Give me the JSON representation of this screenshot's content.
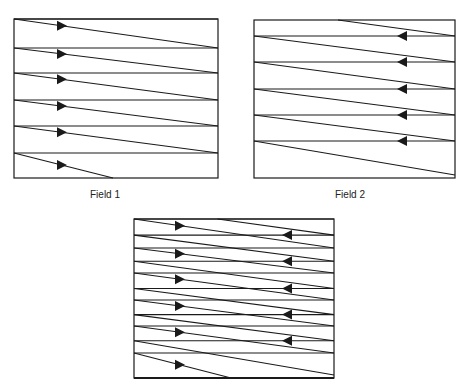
{
  "colors": {
    "line": "#1a1a1a",
    "background": "#ffffff"
  },
  "field1": {
    "label": "Field 1",
    "box": {
      "x1": 14,
      "y1": 19,
      "x2": 218,
      "y2": 178
    },
    "retrace_lines_y": [
      19,
      48,
      73,
      100,
      126,
      153
    ],
    "scan_lines": [
      {
        "from": [
          14,
          19
        ],
        "to": [
          218,
          48
        ]
      },
      {
        "from": [
          14,
          48
        ],
        "to": [
          218,
          73
        ]
      },
      {
        "from": [
          14,
          73
        ],
        "to": [
          218,
          100
        ]
      },
      {
        "from": [
          14,
          100
        ],
        "to": [
          218,
          126
        ]
      },
      {
        "from": [
          14,
          126
        ],
        "to": [
          218,
          153
        ]
      },
      {
        "from": [
          14,
          153
        ],
        "to": [
          113,
          178
        ]
      }
    ],
    "arrow_direction": "right",
    "arrow_x": 62
  },
  "field2": {
    "label": "Field 2",
    "box": {
      "x1": 254,
      "y1": 20,
      "x2": 455,
      "y2": 178
    },
    "retrace_lines_y": [
      36,
      62,
      89,
      115,
      141
    ],
    "scan_lines": [
      {
        "from": [
          338,
          20
        ],
        "to": [
          455,
          36
        ]
      },
      {
        "from": [
          254,
          36
        ],
        "to": [
          455,
          62
        ]
      },
      {
        "from": [
          254,
          62
        ],
        "to": [
          455,
          89
        ]
      },
      {
        "from": [
          254,
          89
        ],
        "to": [
          455,
          115
        ]
      },
      {
        "from": [
          254,
          115
        ],
        "to": [
          455,
          141
        ]
      },
      {
        "from": [
          254,
          141
        ],
        "to": [
          455,
          175
        ]
      }
    ],
    "arrow_direction": "left",
    "arrow_x": 402
  },
  "frame": {
    "label": "",
    "box": {
      "x1": 134,
      "y1": 219,
      "x2": 334,
      "y2": 378
    },
    "description": "Combined interlaced frame (Field 1 + Field 2)"
  }
}
